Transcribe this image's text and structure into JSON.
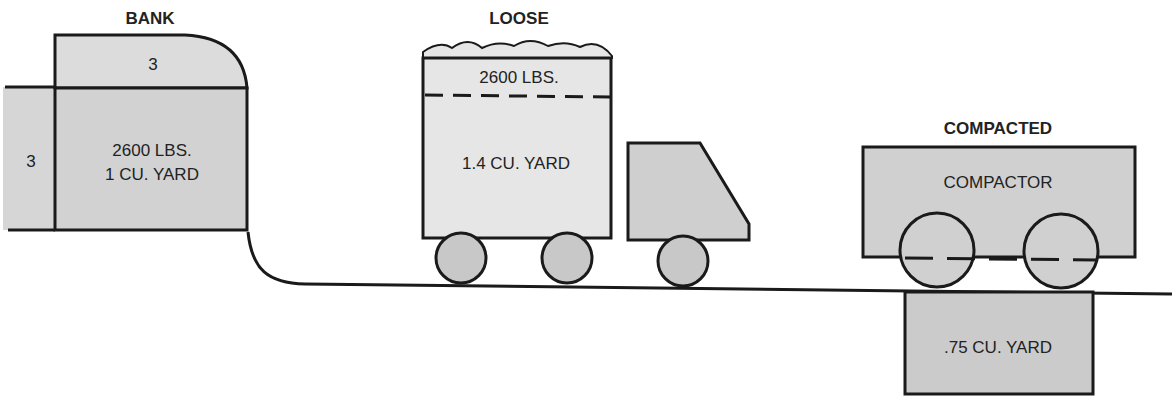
{
  "diagram": {
    "colors": {
      "stroke": "#1a1a1a",
      "bank_fill": "#d2d2d2",
      "bank_top_fill": "#dcdcdc",
      "loose_fill": "#e6e6e6",
      "cab_fill": "#cfcfcf",
      "wheel_fill": "#c8c8c8",
      "compactor_fill": "#d0d0d0",
      "compacted_fill": "#cbcbcb"
    },
    "bank": {
      "title": "BANK",
      "top_dimension": "3",
      "side_dimension": "3",
      "weight": "2600 LBS.",
      "volume": "1 CU. YARD"
    },
    "loose": {
      "title": "LOOSE",
      "weight": "2600 LBS.",
      "volume": "1.4 CU. YARD"
    },
    "compacted": {
      "title": "COMPACTED",
      "machine_label": "COMPACTOR",
      "volume": ".75 CU. YARD"
    }
  }
}
